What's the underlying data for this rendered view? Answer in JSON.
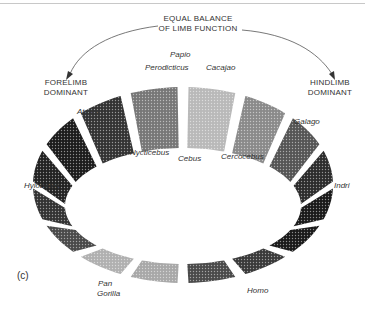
{
  "title": {
    "line1": "EQUAL BALANCE",
    "line2": "OF LIMB FUNCTION"
  },
  "left_pole": {
    "line1": "FORELIMB",
    "line2": "DOMINANT"
  },
  "right_pole": {
    "line1": "HINDLIMB",
    "line2": "DOMINANT"
  },
  "panel_label": "(c)",
  "genera": {
    "papio": "Papio",
    "perodicticus": "Perodicticus",
    "cacajao": "Cacajao",
    "ateles": "Ateles",
    "galago": "Galago",
    "nycticebus": "Nycticebus",
    "cebus": "Cebus",
    "cercocebus": "Cercocebus",
    "hylobates": "Hylobates",
    "indri": "Indri",
    "pan": "Pan",
    "gorilla": "Gorilla",
    "homo": "Homo"
  },
  "ring": {
    "segment_count": 16,
    "shades": [
      "#b9b9b9",
      "#8a8a8a",
      "#555555",
      "#2c2c2c",
      "#1a1a1a",
      "#1a1a1a",
      "#3a3a3a",
      "#4a4a4a",
      "#a8a8a8",
      "#b0b0b0",
      "#4a4a4a",
      "#333333",
      "#222222",
      "#1c1c1c",
      "#333333",
      "#777777"
    ]
  },
  "colors": {
    "ink": "#333333",
    "arrow": "#555555"
  }
}
